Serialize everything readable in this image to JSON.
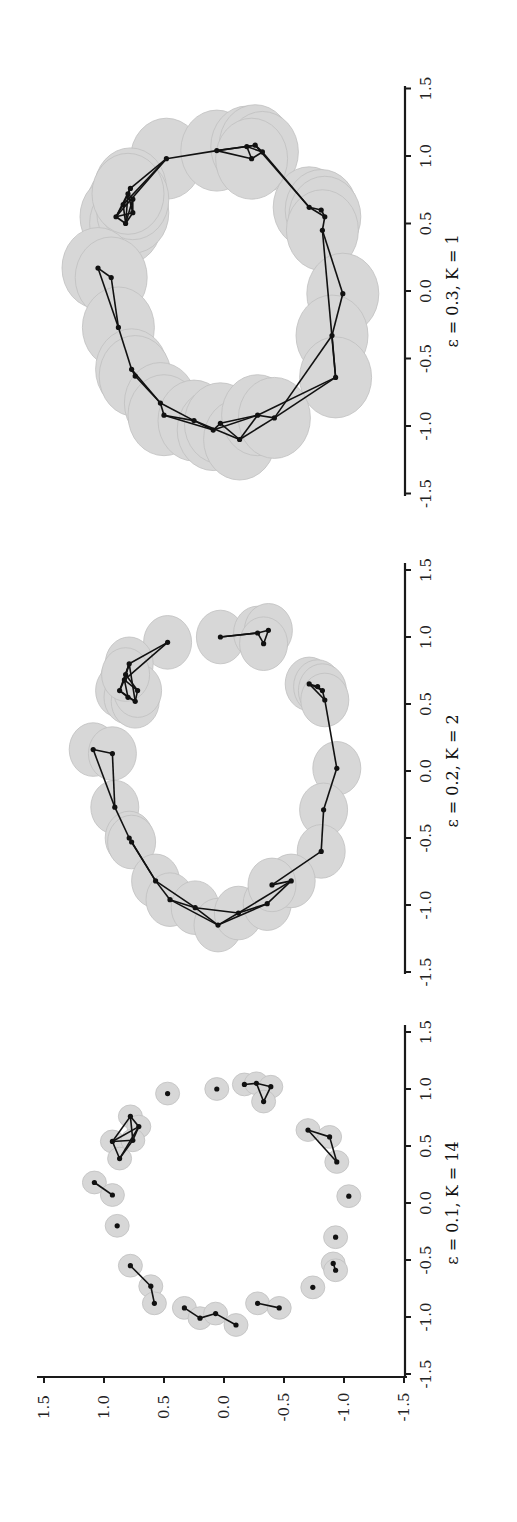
{
  "figure": {
    "orientation": "rotated-90-ccw",
    "background": "#ffffff",
    "axis_color": "#1a1a1a",
    "ball_fill": "#c8c8c8",
    "ball_stroke": "#a8a8a8",
    "edge_color": "#111111",
    "point_color": "#111111"
  },
  "chart_data": [
    {
      "type": "scatter",
      "title": "ε = 0.1, K = 14",
      "epsilon": 0.1,
      "K": 14,
      "xlim": [
        -1.5,
        1.5
      ],
      "ylim": [
        -1.5,
        1.5
      ],
      "xticks": [
        "-1.5",
        "-1.0",
        "-0.5",
        "0.0",
        "0.5",
        "1.0",
        "1.5"
      ],
      "yticks": [
        "-1.5",
        "-1.0",
        "-0.5",
        "0.0",
        "0.5",
        "1.0",
        "1.5"
      ],
      "points": [
        [
          0.96,
          0.47
        ],
        [
          1.0,
          0.06
        ],
        [
          1.04,
          -0.17
        ],
        [
          1.05,
          -0.27
        ],
        [
          1.02,
          -0.39
        ],
        [
          0.89,
          -0.33
        ],
        [
          0.76,
          0.78
        ],
        [
          0.67,
          0.71
        ],
        [
          0.54,
          0.93
        ],
        [
          0.39,
          0.87
        ],
        [
          0.55,
          0.76
        ],
        [
          0.64,
          -0.7
        ],
        [
          0.58,
          -0.88
        ],
        [
          0.36,
          -0.94
        ],
        [
          0.18,
          1.08
        ],
        [
          0.07,
          0.93
        ],
        [
          0.06,
          -1.04
        ],
        [
          -0.2,
          0.89
        ],
        [
          -0.3,
          -0.93
        ],
        [
          -0.53,
          -0.91
        ],
        [
          -0.59,
          -0.93
        ],
        [
          -0.74,
          -0.74
        ],
        [
          -0.55,
          0.78
        ],
        [
          -0.73,
          0.61
        ],
        [
          -0.88,
          0.58
        ],
        [
          -0.92,
          0.33
        ],
        [
          -1.01,
          0.2
        ],
        [
          -0.97,
          0.07
        ],
        [
          -1.07,
          -0.1
        ],
        [
          -0.88,
          -0.28
        ],
        [
          -0.92,
          -0.46
        ]
      ],
      "edges": [
        [
          2,
          3
        ],
        [
          3,
          4
        ],
        [
          4,
          5
        ],
        [
          5,
          3
        ],
        [
          6,
          7
        ],
        [
          7,
          8
        ],
        [
          8,
          9
        ],
        [
          9,
          10
        ],
        [
          10,
          6
        ],
        [
          8,
          10
        ],
        [
          7,
          10
        ],
        [
          6,
          8
        ],
        [
          7,
          9
        ],
        [
          11,
          12
        ],
        [
          12,
          13
        ],
        [
          11,
          13
        ],
        [
          14,
          15
        ],
        [
          19,
          20
        ],
        [
          22,
          23
        ],
        [
          23,
          24
        ],
        [
          25,
          26
        ],
        [
          26,
          27
        ],
        [
          27,
          28
        ],
        [
          29,
          30
        ]
      ]
    },
    {
      "type": "scatter",
      "title": "ε = 0.2, K = 2",
      "epsilon": 0.2,
      "K": 2,
      "xlim": [
        -1.5,
        1.5
      ],
      "ylim": [
        -1.5,
        1.5
      ],
      "xticks": [
        "-1.5",
        "-1.0",
        "-0.5",
        "0.0",
        "0.5",
        "1.0",
        "1.5"
      ],
      "yticks": [
        "-1.5",
        "-1.0",
        "-0.5",
        "0.0",
        "0.5",
        "1.0",
        "1.5"
      ],
      "points": [
        [
          1.0,
          0.03
        ],
        [
          1.03,
          -0.28
        ],
        [
          1.05,
          -0.37
        ],
        [
          0.95,
          -0.33
        ],
        [
          0.96,
          0.47
        ],
        [
          0.8,
          0.79
        ],
        [
          0.68,
          0.83
        ],
        [
          0.6,
          0.87
        ],
        [
          0.55,
          0.8
        ],
        [
          0.52,
          0.74
        ],
        [
          0.6,
          0.72
        ],
        [
          0.72,
          0.82
        ],
        [
          0.65,
          -0.71
        ],
        [
          0.63,
          -0.78
        ],
        [
          0.6,
          -0.82
        ],
        [
          0.53,
          -0.84
        ],
        [
          0.16,
          1.09
        ],
        [
          0.13,
          0.93
        ],
        [
          0.02,
          -0.94
        ],
        [
          -0.27,
          0.91
        ],
        [
          -0.29,
          -0.83
        ],
        [
          -0.5,
          0.79
        ],
        [
          -0.53,
          0.77
        ],
        [
          -0.6,
          -0.81
        ],
        [
          -0.82,
          0.57
        ],
        [
          -0.96,
          0.45
        ],
        [
          -1.02,
          0.24
        ],
        [
          -1.15,
          0.05
        ],
        [
          -1.06,
          -0.12
        ],
        [
          -0.99,
          -0.36
        ],
        [
          -0.82,
          -0.56
        ],
        [
          -0.85,
          -0.4
        ]
      ],
      "edges": [
        [
          0,
          1
        ],
        [
          1,
          2
        ],
        [
          2,
          3
        ],
        [
          3,
          1
        ],
        [
          1,
          0
        ],
        [
          4,
          5
        ],
        [
          5,
          6
        ],
        [
          6,
          7
        ],
        [
          7,
          8
        ],
        [
          8,
          9
        ],
        [
          9,
          10
        ],
        [
          10,
          11
        ],
        [
          11,
          5
        ],
        [
          6,
          8
        ],
        [
          5,
          7
        ],
        [
          7,
          9
        ],
        [
          4,
          6
        ],
        [
          6,
          10
        ],
        [
          9,
          5
        ],
        [
          12,
          13
        ],
        [
          13,
          14
        ],
        [
          14,
          15
        ],
        [
          12,
          14
        ],
        [
          12,
          15
        ],
        [
          15,
          18
        ],
        [
          18,
          20
        ],
        [
          20,
          23
        ],
        [
          17,
          16
        ],
        [
          17,
          19
        ],
        [
          16,
          19
        ],
        [
          19,
          21
        ],
        [
          21,
          22
        ],
        [
          22,
          24
        ],
        [
          21,
          24
        ],
        [
          24,
          25
        ],
        [
          25,
          26
        ],
        [
          26,
          27
        ],
        [
          27,
          28
        ],
        [
          28,
          29
        ],
        [
          29,
          30
        ],
        [
          30,
          31
        ],
        [
          31,
          23
        ],
        [
          24,
          26
        ],
        [
          25,
          27
        ],
        [
          26,
          28
        ],
        [
          27,
          29
        ],
        [
          28,
          30
        ]
      ]
    },
    {
      "type": "scatter",
      "title": "ε = 0.3, K = 1",
      "epsilon": 0.3,
      "K": 1,
      "xlim": [
        -1.5,
        1.5
      ],
      "ylim": [
        -1.5,
        1.5
      ],
      "xticks": [
        "-1.5",
        "-1.0",
        "-0.5",
        "0.0",
        "0.5",
        "1.0",
        "1.5"
      ],
      "yticks": [
        "-1.5",
        "-1.0",
        "-0.5",
        "0.0",
        "0.5",
        "1.0",
        "1.5"
      ],
      "points": [
        [
          0.98,
          0.48
        ],
        [
          1.04,
          0.06
        ],
        [
          1.07,
          -0.19
        ],
        [
          1.08,
          -0.26
        ],
        [
          1.03,
          -0.32
        ],
        [
          0.98,
          -0.23
        ],
        [
          0.76,
          0.78
        ],
        [
          0.64,
          0.84
        ],
        [
          0.55,
          0.9
        ],
        [
          0.5,
          0.82
        ],
        [
          0.58,
          0.76
        ],
        [
          0.68,
          0.76
        ],
        [
          0.72,
          0.8
        ],
        [
          0.62,
          -0.71
        ],
        [
          0.6,
          -0.81
        ],
        [
          0.55,
          -0.84
        ],
        [
          0.45,
          -0.82
        ],
        [
          0.17,
          1.05
        ],
        [
          0.1,
          0.94
        ],
        [
          -0.02,
          -0.99
        ],
        [
          -0.27,
          0.88
        ],
        [
          -0.33,
          -0.9
        ],
        [
          -0.58,
          0.77
        ],
        [
          -0.63,
          0.74
        ],
        [
          -0.64,
          -0.93
        ],
        [
          -0.83,
          0.53
        ],
        [
          -0.92,
          0.5
        ],
        [
          -0.96,
          0.25
        ],
        [
          -1.03,
          0.09
        ],
        [
          -0.98,
          0.03
        ],
        [
          -1.1,
          -0.13
        ],
        [
          -0.92,
          -0.28
        ],
        [
          -0.94,
          -0.42
        ]
      ],
      "edges": [
        [
          0,
          1
        ],
        [
          1,
          2
        ],
        [
          2,
          3
        ],
        [
          3,
          4
        ],
        [
          4,
          5
        ],
        [
          5,
          2
        ],
        [
          1,
          5
        ],
        [
          1,
          3
        ],
        [
          2,
          4
        ],
        [
          0,
          6
        ],
        [
          6,
          7
        ],
        [
          7,
          8
        ],
        [
          8,
          9
        ],
        [
          9,
          10
        ],
        [
          10,
          11
        ],
        [
          11,
          12
        ],
        [
          12,
          6
        ],
        [
          6,
          8
        ],
        [
          7,
          9
        ],
        [
          8,
          10
        ],
        [
          9,
          11
        ],
        [
          10,
          12
        ],
        [
          0,
          7
        ],
        [
          0,
          8
        ],
        [
          9,
          12
        ],
        [
          13,
          14
        ],
        [
          14,
          15
        ],
        [
          15,
          16
        ],
        [
          13,
          15
        ],
        [
          4,
          13
        ],
        [
          3,
          13
        ],
        [
          16,
          19
        ],
        [
          19,
          21
        ],
        [
          21,
          24
        ],
        [
          16,
          24
        ],
        [
          17,
          18
        ],
        [
          18,
          20
        ],
        [
          17,
          20
        ],
        [
          20,
          22
        ],
        [
          22,
          23
        ],
        [
          22,
          25
        ],
        [
          23,
          25
        ],
        [
          25,
          26
        ],
        [
          26,
          27
        ],
        [
          27,
          28
        ],
        [
          28,
          29
        ],
        [
          29,
          30
        ],
        [
          30,
          31
        ],
        [
          31,
          32
        ],
        [
          32,
          24
        ],
        [
          25,
          27
        ],
        [
          26,
          28
        ],
        [
          27,
          30
        ],
        [
          28,
          31
        ],
        [
          29,
          31
        ],
        [
          30,
          32
        ],
        [
          31,
          24
        ],
        [
          21,
          32
        ]
      ]
    }
  ]
}
